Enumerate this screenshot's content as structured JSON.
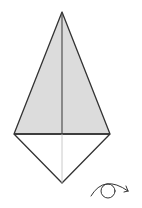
{
  "diagram": {
    "type": "origami-step",
    "colors": {
      "background": "#ffffff",
      "line": "#333333",
      "shade": "#dcdcdc",
      "center_crease": "#bdbdbd"
    },
    "shape": {
      "apex": [
        62,
        12
      ],
      "left": [
        14,
        134
      ],
      "right": [
        110,
        134
      ],
      "bottom": [
        62,
        183
      ]
    },
    "symbols": [
      {
        "name": "turn-over-arrow",
        "meaning": "Turn the model over"
      }
    ]
  }
}
